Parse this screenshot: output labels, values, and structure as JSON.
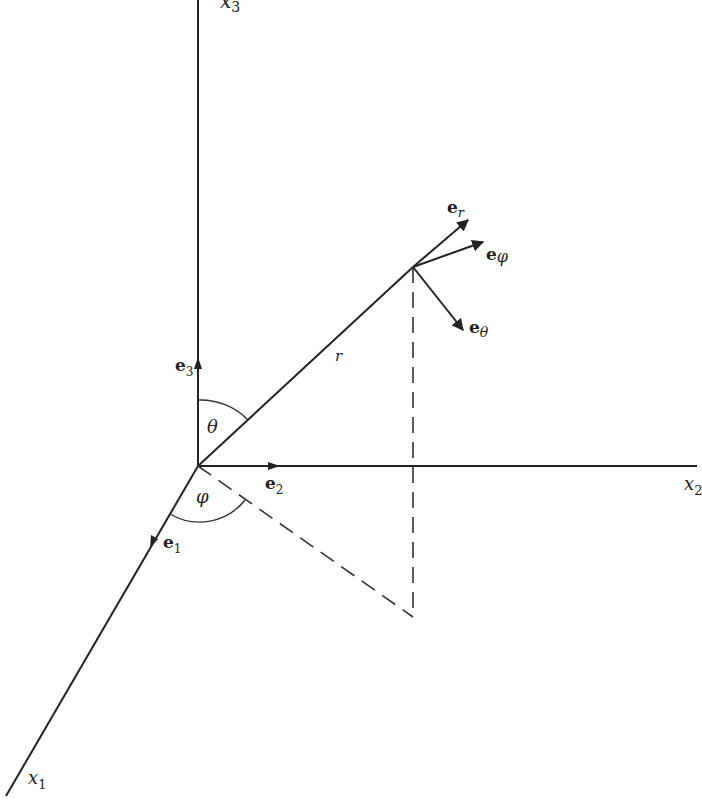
{
  "diagram": {
    "axes": {
      "x1": {
        "label": "x",
        "subscript": "1"
      },
      "x2": {
        "label": "x",
        "subscript": "2"
      },
      "x3": {
        "label": "x",
        "subscript": "3"
      }
    },
    "basis_vectors": {
      "e1": {
        "label": "e",
        "subscript": "1"
      },
      "e2": {
        "label": "e",
        "subscript": "2"
      },
      "e3": {
        "label": "e",
        "subscript": "3"
      }
    },
    "spherical_vectors": {
      "er": {
        "label": "e",
        "subscript": "r"
      },
      "ephi": {
        "label": "e",
        "subscript": "φ"
      },
      "etheta": {
        "label": "e",
        "subscript": "θ"
      }
    },
    "angles": {
      "theta": "θ",
      "phi": "φ"
    },
    "radius_label": "r",
    "colors": {
      "ink": "#222222",
      "background": "#ffffff"
    }
  }
}
